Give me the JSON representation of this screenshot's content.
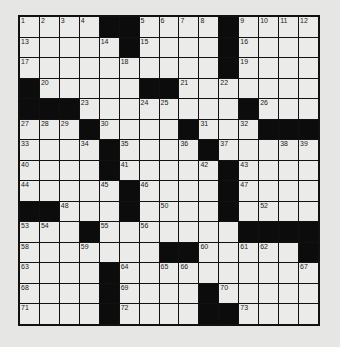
{
  "puzzle": {
    "rows": 15,
    "cols": 15,
    "layout": [
      "....##....#....",
      ".....#....#....",
      "..........#....",
      "#.....##.......",
      "###........#...",
      "...#....#...###",
      "....#....#.....",
      "....#.....#....",
      ".....#....#....",
      "##...#....#....",
      "...#.......####",
      ".......##.....#",
      "....#..........",
      "....#....#.....",
      "....#....##...."
    ],
    "numbers": [
      {
        "r": 0,
        "c": 0,
        "n": 1
      },
      {
        "r": 0,
        "c": 1,
        "n": 2
      },
      {
        "r": 0,
        "c": 2,
        "n": 3
      },
      {
        "r": 0,
        "c": 3,
        "n": 4
      },
      {
        "r": 0,
        "c": 6,
        "n": 5
      },
      {
        "r": 0,
        "c": 7,
        "n": 6
      },
      {
        "r": 0,
        "c": 8,
        "n": 7
      },
      {
        "r": 0,
        "c": 9,
        "n": 8
      },
      {
        "r": 0,
        "c": 11,
        "n": 9
      },
      {
        "r": 0,
        "c": 12,
        "n": 10
      },
      {
        "r": 0,
        "c": 13,
        "n": 11
      },
      {
        "r": 0,
        "c": 14,
        "n": 12
      },
      {
        "r": 1,
        "c": 0,
        "n": 13
      },
      {
        "r": 1,
        "c": 4,
        "n": 14
      },
      {
        "r": 1,
        "c": 6,
        "n": 15
      },
      {
        "r": 1,
        "c": 11,
        "n": 16
      },
      {
        "r": 2,
        "c": 0,
        "n": 17
      },
      {
        "r": 2,
        "c": 5,
        "n": 18
      },
      {
        "r": 2,
        "c": 11,
        "n": 19
      },
      {
        "r": 3,
        "c": 1,
        "n": 20
      },
      {
        "r": 3,
        "c": 8,
        "n": 21
      },
      {
        "r": 3,
        "c": 10,
        "n": 22
      },
      {
        "r": 4,
        "c": 3,
        "n": 23
      },
      {
        "r": 4,
        "c": 6,
        "n": 24
      },
      {
        "r": 4,
        "c": 7,
        "n": 25
      },
      {
        "r": 4,
        "c": 12,
        "n": 26
      },
      {
        "r": 5,
        "c": 0,
        "n": 27
      },
      {
        "r": 5,
        "c": 1,
        "n": 28
      },
      {
        "r": 5,
        "c": 2,
        "n": 29
      },
      {
        "r": 5,
        "c": 4,
        "n": 30
      },
      {
        "r": 5,
        "c": 9,
        "n": 31
      },
      {
        "r": 5,
        "c": 11,
        "n": 32
      },
      {
        "r": 6,
        "c": 0,
        "n": 33
      },
      {
        "r": 6,
        "c": 3,
        "n": 34
      },
      {
        "r": 6,
        "c": 5,
        "n": 35
      },
      {
        "r": 6,
        "c": 8,
        "n": 36
      },
      {
        "r": 6,
        "c": 10,
        "n": 37
      },
      {
        "r": 6,
        "c": 13,
        "n": 38
      },
      {
        "r": 6,
        "c": 14,
        "n": 39
      },
      {
        "r": 7,
        "c": 0,
        "n": 40
      },
      {
        "r": 7,
        "c": 5,
        "n": 41
      },
      {
        "r": 7,
        "c": 9,
        "n": 42
      },
      {
        "r": 7,
        "c": 11,
        "n": 43
      },
      {
        "r": 8,
        "c": 0,
        "n": 44
      },
      {
        "r": 8,
        "c": 4,
        "n": 45
      },
      {
        "r": 8,
        "c": 6,
        "n": 46
      },
      {
        "r": 8,
        "c": 11,
        "n": 47
      },
      {
        "r": 9,
        "c": 2,
        "n": 48
      },
      {
        "r": 9,
        "c": 5,
        "n": 49
      },
      {
        "r": 9,
        "c": 7,
        "n": 50
      },
      {
        "r": 9,
        "c": 10,
        "n": 51
      },
      {
        "r": 9,
        "c": 12,
        "n": 52
      },
      {
        "r": 10,
        "c": 0,
        "n": 53
      },
      {
        "r": 10,
        "c": 1,
        "n": 54
      },
      {
        "r": 10,
        "c": 4,
        "n": 55
      },
      {
        "r": 10,
        "c": 6,
        "n": 56
      },
      {
        "r": 10,
        "c": 11,
        "n": 57
      },
      {
        "r": 11,
        "c": 0,
        "n": 58
      },
      {
        "r": 11,
        "c": 3,
        "n": 59
      },
      {
        "r": 11,
        "c": 9,
        "n": 60
      },
      {
        "r": 11,
        "c": 11,
        "n": 61
      },
      {
        "r": 11,
        "c": 12,
        "n": 62
      },
      {
        "r": 12,
        "c": 0,
        "n": 63
      },
      {
        "r": 12,
        "c": 5,
        "n": 64
      },
      {
        "r": 12,
        "c": 7,
        "n": 65
      },
      {
        "r": 12,
        "c": 8,
        "n": 66
      },
      {
        "r": 12,
        "c": 14,
        "n": 67
      },
      {
        "r": 13,
        "c": 0,
        "n": 68
      },
      {
        "r": 13,
        "c": 5,
        "n": 69
      },
      {
        "r": 13,
        "c": 10,
        "n": 70
      },
      {
        "r": 14,
        "c": 0,
        "n": 71
      },
      {
        "r": 14,
        "c": 5,
        "n": 72
      },
      {
        "r": 14,
        "c": 11,
        "n": 73
      }
    ]
  },
  "colors": {
    "background": "#e6e6e4",
    "cell": "#ebebea",
    "block": "#0c0c0c"
  }
}
